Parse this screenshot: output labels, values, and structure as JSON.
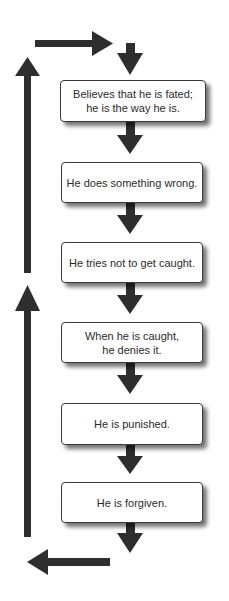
{
  "diagram": {
    "type": "cycle-flowchart",
    "steps": [
      {
        "id": 1,
        "text": "Believes that he is fated;\nhe is the way he is."
      },
      {
        "id": 2,
        "text": "He does something wrong."
      },
      {
        "id": 3,
        "text": "He tries not to get caught."
      },
      {
        "id": 4,
        "text": "When he is caught,\nhe denies it."
      },
      {
        "id": 5,
        "text": "He is punished."
      },
      {
        "id": 6,
        "text": "He is forgiven."
      }
    ],
    "flow": "top-to-bottom with return loop on the left back to top",
    "colors": {
      "arrow": "#2e2e2e",
      "box_border": "#3a3a3a",
      "box_fill": "#ffffff",
      "text": "#2b2b2b",
      "background": "#ffffff"
    }
  }
}
